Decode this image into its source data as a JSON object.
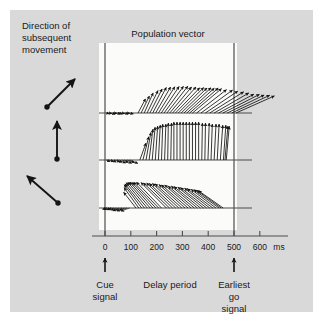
{
  "figure": {
    "title": "Population vector",
    "left_caption": [
      "Direction of",
      "subsequent",
      "movement"
    ],
    "axis_unit_label": "ms",
    "x_tick_labels": [
      "0",
      "100",
      "200",
      "300",
      "400",
      "500",
      "600"
    ],
    "annotations": {
      "cue": [
        "Cue",
        "signal"
      ],
      "delay": [
        "Delay period"
      ],
      "earliest_go": [
        "Earliest",
        "go",
        "signal"
      ]
    },
    "colors": {
      "background": "#d9d9d9",
      "plot_area": "#fbfbfa",
      "ink": "#1a1a1a",
      "axis": "#4d4d4d"
    }
  },
  "chart_data": {
    "type": "scatter",
    "title": "Population vector",
    "xlabel": "ms",
    "ylabel": "",
    "xlim": [
      -55,
      660
    ],
    "grid": false,
    "legend": null,
    "annotations": [
      {
        "label": "Cue signal",
        "x": 0
      },
      {
        "label": "Delay period",
        "x": 250
      },
      {
        "label": "Earliest go signal",
        "x": 500
      }
    ],
    "event_lines_ms": [
      0,
      500
    ],
    "direction_keys_deg": [
      45,
      90,
      135
    ],
    "series": [
      {
        "name": "Direction 45 deg (up-right)",
        "baseline_row": 0,
        "angles_deg": [
          -14,
          -10,
          -18,
          -8,
          -14,
          -20,
          -12,
          -16,
          -10,
          -14,
          62,
          64,
          66,
          64,
          63,
          62,
          60,
          58,
          56,
          54,
          52,
          50,
          48,
          46,
          45,
          44,
          43,
          42,
          41,
          40,
          38,
          36,
          34,
          32,
          30,
          28,
          27,
          26,
          25,
          24
        ],
        "magnitudes": [
          3,
          3,
          4,
          3,
          4,
          3,
          3,
          4,
          3,
          4,
          16,
          19,
          22,
          25,
          27,
          29,
          30,
          31,
          32,
          33,
          34,
          34,
          35,
          35,
          36,
          36,
          37,
          37,
          38,
          38,
          38,
          39,
          39,
          40,
          40,
          40,
          41,
          41,
          42,
          42
        ],
        "x_ms": [
          5,
          15,
          25,
          35,
          45,
          55,
          65,
          75,
          85,
          95,
          128,
          140,
          152,
          163,
          174,
          185,
          196,
          207,
          218,
          229,
          240,
          251,
          262,
          273,
          284,
          295,
          306,
          317,
          328,
          339,
          355,
          372,
          389,
          406,
          423,
          440,
          457,
          474,
          491,
          508
        ]
      },
      {
        "name": "Direction 90 deg (up)",
        "baseline_row": 1,
        "angles_deg": [
          -22,
          -20,
          -24,
          -18,
          -22,
          -26,
          -20,
          -24,
          -18,
          -22,
          70,
          76,
          80,
          83,
          85,
          86,
          87,
          88,
          88,
          89,
          89,
          90,
          90,
          90,
          90,
          90,
          90,
          90,
          90,
          90,
          89,
          89,
          88,
          88,
          87,
          87,
          86,
          86,
          85,
          85
        ],
        "magnitudes": [
          4,
          5,
          5,
          6,
          6,
          7,
          7,
          8,
          8,
          9,
          18,
          24,
          28,
          31,
          33,
          34,
          35,
          36,
          36,
          37,
          37,
          38,
          38,
          38,
          38,
          38,
          38,
          38,
          38,
          38,
          37,
          37,
          37,
          36,
          36,
          36,
          35,
          35,
          34,
          34
        ],
        "x_ms": [
          5,
          15,
          25,
          35,
          45,
          55,
          65,
          75,
          85,
          95,
          135,
          147,
          159,
          171,
          183,
          195,
          207,
          219,
          231,
          243,
          255,
          267,
          279,
          291,
          303,
          315,
          327,
          339,
          351,
          363,
          375,
          387,
          399,
          411,
          423,
          435,
          447,
          459,
          465,
          470
        ]
      },
      {
        "name": "Direction 135 deg (up-left)",
        "baseline_row": 2,
        "angles_deg": [
          -160,
          -164,
          -158,
          -166,
          -160,
          -156,
          -162,
          -158,
          -164,
          -160,
          128,
          126,
          127,
          129,
          130,
          131,
          132,
          133,
          134,
          134,
          135,
          136,
          136,
          137,
          137,
          138,
          138,
          139,
          139,
          140,
          140,
          141,
          141,
          142,
          142,
          143,
          143,
          144,
          144,
          145
        ],
        "magnitudes": [
          4,
          5,
          5,
          6,
          6,
          7,
          7,
          8,
          8,
          9,
          20,
          25,
          29,
          31,
          33,
          34,
          35,
          35,
          36,
          36,
          36,
          36,
          36,
          36,
          36,
          36,
          35,
          35,
          35,
          34,
          34,
          34,
          33,
          33,
          32,
          32,
          31,
          31,
          30,
          30
        ],
        "x_ms": [
          5,
          15,
          25,
          35,
          45,
          55,
          65,
          75,
          85,
          95,
          120,
          131,
          142,
          153,
          164,
          175,
          186,
          197,
          208,
          219,
          238,
          250,
          262,
          274,
          286,
          298,
          310,
          322,
          334,
          346,
          358,
          370,
          382,
          394,
          406,
          418,
          430,
          442,
          450,
          458
        ]
      }
    ]
  }
}
